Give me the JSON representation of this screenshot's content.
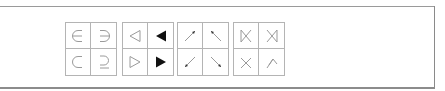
{
  "palettes": [
    {
      "name": "set-relations",
      "symbols": [
        {
          "icon": "element-of-icon",
          "char": "∈"
        },
        {
          "icon": "contains-as-member-icon",
          "char": "∋"
        },
        {
          "icon": "subset-of-icon",
          "char": "⊂"
        },
        {
          "icon": "superset-of-or-equal-icon",
          "char": "⊇"
        }
      ]
    },
    {
      "name": "triangles",
      "symbols": [
        {
          "icon": "white-left-triangle-icon",
          "char": "◁"
        },
        {
          "icon": "black-left-triangle-icon",
          "char": "◀"
        },
        {
          "icon": "white-right-triangle-icon",
          "char": "▷"
        },
        {
          "icon": "black-right-triangle-icon",
          "char": "▶"
        }
      ]
    },
    {
      "name": "diagonal-arrows",
      "symbols": [
        {
          "icon": "north-east-arrow-icon",
          "char": "↗"
        },
        {
          "icon": "north-west-arrow-icon",
          "char": "↖"
        },
        {
          "icon": "south-west-arrow-icon",
          "char": "↙"
        },
        {
          "icon": "south-east-arrow-icon",
          "char": "↘"
        }
      ]
    },
    {
      "name": "bowtie-joins",
      "symbols": [
        {
          "icon": "left-semijoin-icon",
          "char": "⋉"
        },
        {
          "icon": "right-semijoin-icon",
          "char": "⋊"
        },
        {
          "icon": "cross-lower-icon",
          "char": "╳"
        },
        {
          "icon": "wedge-cross-icon",
          "char": "⋌"
        }
      ]
    }
  ],
  "colors": {
    "stroke": "#9a9a9a",
    "fill_dark": "#111111",
    "grid": "#b4b4b4"
  }
}
